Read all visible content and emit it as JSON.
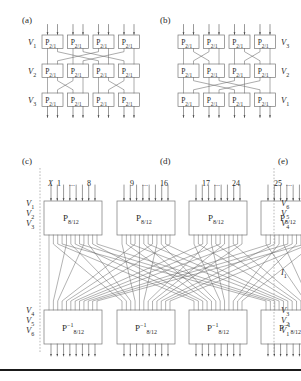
{
  "figure": {
    "title_panels": [
      {
        "id": "a",
        "label": "(a)"
      },
      {
        "id": "b",
        "label": "(b)"
      },
      {
        "id": "c",
        "label": "(c)"
      },
      {
        "id": "d",
        "label": "(d)"
      },
      {
        "id": "e",
        "label": "(e)"
      }
    ],
    "panel_a": {
      "letter": "(a)",
      "row_labels": [
        "V1",
        "V2",
        "V3"
      ],
      "row_labels_display": [
        "V",
        "V",
        "V"
      ],
      "row_sub": [
        "1",
        "2",
        "3"
      ],
      "box_label_base": "P",
      "box_label_sub": "2/1",
      "columns": 4,
      "rows": 3,
      "inputs_per_box": 2
    },
    "panel_b": {
      "letter": "(b)",
      "row_labels_display": [
        "V",
        "V",
        "V"
      ],
      "row_sub": [
        "3",
        "2",
        "1"
      ],
      "box_label_base": "P",
      "box_label_sub": "2/1",
      "columns": 4,
      "rows": 3,
      "inputs_per_box": 2
    },
    "panel_c": {
      "letter": "(c)",
      "x_label": "X",
      "ranges": [
        {
          "start": "1",
          "dots": "...",
          "end": "8"
        },
        {
          "start": "9",
          "dots": "...",
          "end": "16"
        },
        {
          "start": "17",
          "dots": "...",
          "end": "24"
        },
        {
          "start": "25",
          "dots": "...",
          "end": "32"
        }
      ],
      "left_labels_top_display": [
        "V",
        "V",
        "V"
      ],
      "left_labels_top_sub": [
        "1",
        "2",
        "3"
      ],
      "left_labels_bottom_display": [
        "V",
        "V",
        "V"
      ],
      "left_labels_bottom_sub": [
        "4",
        "5",
        "6"
      ],
      "right_labels_top_display": [
        "V",
        "V",
        "V"
      ],
      "right_labels_top_sub": [
        "6",
        "5",
        "4"
      ],
      "right_labels_bottom_display": [
        "V",
        "V",
        "V"
      ],
      "right_labels_bottom_sub": [
        "3",
        "2",
        "1"
      ],
      "middle_right_label_display": "I",
      "middle_right_label_sub": "1",
      "top_box_base": "P",
      "top_box_sub": "8/12",
      "bottom_box_base": "P",
      "bottom_box_sub": "8/12",
      "bottom_box_sup": "−1",
      "columns": 4,
      "lines_per_box": 8,
      "out_lines_per_box": 12
    },
    "panel_d": {
      "letter": "(d)"
    },
    "panel_e": {
      "letter": "(e)"
    }
  },
  "colors": {
    "background": "#ffffff",
    "stroke": "#555555",
    "box_stroke": "#777777",
    "wire": "#666666",
    "text": "#2a2a2a",
    "dashed_guide": "#888888",
    "bottom_rule": "#1a1a1a"
  }
}
